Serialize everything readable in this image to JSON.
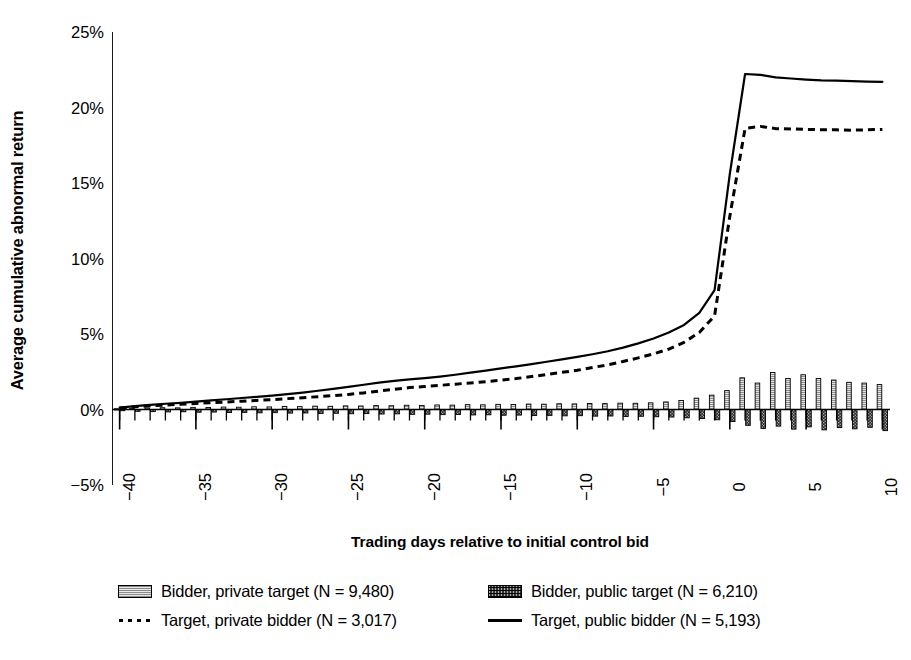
{
  "chart_data": {
    "type": "line",
    "title": "",
    "xlabel": "Trading days relative to initial control bid",
    "ylabel": "Average cumulative abnormal return",
    "xlim": [
      -40.5,
      10.5
    ],
    "ylim": [
      -0.05,
      0.25
    ],
    "ytick_labels": [
      "25%",
      "20%",
      "15%",
      "10%",
      "5%",
      "0%",
      "−5%"
    ],
    "ytick_values": [
      0.25,
      0.2,
      0.15,
      0.1,
      0.05,
      0.0,
      -0.05
    ],
    "xtick_labels": [
      "−40",
      "−35",
      "−30",
      "−25",
      "−20",
      "−15",
      "−10",
      "−5",
      "0",
      "5",
      "10"
    ],
    "xtick_values": [
      -40,
      -35,
      -30,
      -25,
      -20,
      -15,
      -10,
      -5,
      0,
      5,
      10
    ],
    "grid": false,
    "legend_position": "below",
    "x": [
      -40,
      -39,
      -38,
      -37,
      -36,
      -35,
      -34,
      -33,
      -32,
      -31,
      -30,
      -29,
      -28,
      -27,
      -26,
      -25,
      -24,
      -23,
      -22,
      -21,
      -20,
      -19,
      -18,
      -17,
      -16,
      -15,
      -14,
      -13,
      -12,
      -11,
      -10,
      -9,
      -8,
      -7,
      -6,
      -5,
      -4,
      -3,
      -2,
      -1,
      0,
      1,
      2,
      3,
      4,
      5,
      6,
      7,
      8,
      9,
      10
    ],
    "series": [
      {
        "name": "Bidder, private target (N = 9,480)",
        "style": "bar",
        "fill": "light-hatch",
        "values": [
          0.0005,
          0.0008,
          0.001,
          0.0012,
          0.0011,
          0.0014,
          0.0013,
          0.0016,
          0.0015,
          0.0018,
          0.0017,
          0.002,
          0.0019,
          0.0022,
          0.0021,
          0.0024,
          0.0023,
          0.0026,
          0.0025,
          0.0028,
          0.0027,
          0.003,
          0.0029,
          0.0032,
          0.0031,
          0.0034,
          0.0033,
          0.0036,
          0.0035,
          0.0038,
          0.0037,
          0.004,
          0.0039,
          0.0042,
          0.0041,
          0.0044,
          0.005,
          0.006,
          0.0075,
          0.0095,
          0.0125,
          0.021,
          0.0175,
          0.0245,
          0.0205,
          0.023,
          0.0205,
          0.0195,
          0.018,
          0.0175,
          0.0165
        ]
      },
      {
        "name": "Bidder, public target (N = 6,210)",
        "style": "bar",
        "fill": "dark-hatch",
        "values": [
          -0.0008,
          -0.0012,
          -0.0014,
          -0.0016,
          -0.0015,
          -0.0018,
          -0.0017,
          -0.002,
          -0.0019,
          -0.0022,
          -0.0021,
          -0.0024,
          -0.0023,
          -0.0026,
          -0.0025,
          -0.0028,
          -0.0027,
          -0.003,
          -0.0029,
          -0.0032,
          -0.0031,
          -0.0034,
          -0.0033,
          -0.0036,
          -0.0035,
          -0.0038,
          -0.0037,
          -0.004,
          -0.0039,
          -0.0042,
          -0.0041,
          -0.0044,
          -0.0043,
          -0.0046,
          -0.0045,
          -0.0048,
          -0.005,
          -0.0055,
          -0.006,
          -0.0068,
          -0.008,
          -0.0105,
          -0.0125,
          -0.011,
          -0.013,
          -0.0115,
          -0.0135,
          -0.012,
          -0.0128,
          -0.0118,
          -0.014
        ]
      },
      {
        "name": "Target, private bidder (N = 3,017)",
        "style": "dashed-line",
        "values": [
          0.001,
          0.0018,
          0.0024,
          0.003,
          0.0034,
          0.004,
          0.0045,
          0.005,
          0.0055,
          0.006,
          0.0065,
          0.0072,
          0.0078,
          0.0085,
          0.0092,
          0.01,
          0.011,
          0.0122,
          0.0134,
          0.0145,
          0.0152,
          0.016,
          0.0168,
          0.0176,
          0.0184,
          0.0195,
          0.0205,
          0.0218,
          0.0232,
          0.0246,
          0.026,
          0.0278,
          0.0296,
          0.0318,
          0.0342,
          0.0368,
          0.04,
          0.0445,
          0.051,
          0.062,
          0.128,
          0.1862,
          0.1875,
          0.186,
          0.1858,
          0.1855,
          0.1853,
          0.1852,
          0.185,
          0.1852,
          0.1855
        ]
      },
      {
        "name": "Target, public bidder (N = 5,193)",
        "style": "solid-line",
        "values": [
          0.0012,
          0.0022,
          0.003,
          0.0038,
          0.0044,
          0.0052,
          0.006,
          0.0068,
          0.0076,
          0.0084,
          0.0092,
          0.0102,
          0.0112,
          0.0124,
          0.0136,
          0.015,
          0.0164,
          0.0178,
          0.019,
          0.02,
          0.0208,
          0.0218,
          0.023,
          0.0244,
          0.0258,
          0.0272,
          0.0286,
          0.03,
          0.0316,
          0.0332,
          0.0348,
          0.0366,
          0.0386,
          0.041,
          0.0438,
          0.047,
          0.051,
          0.056,
          0.064,
          0.079,
          0.156,
          0.2222,
          0.2216,
          0.22,
          0.2192,
          0.2185,
          0.218,
          0.2178,
          0.2175,
          0.2172,
          0.217
        ]
      }
    ],
    "annotations": []
  },
  "legend": {
    "rows": [
      [
        {
          "label": "Bidder, private target (N = 9,480)",
          "marker": "light-bar"
        },
        {
          "label": "Bidder, public target (N = 6,210)",
          "marker": "dark-bar"
        }
      ],
      [
        {
          "label": "Target, private bidder (N = 3,017)",
          "marker": "dashed-line"
        },
        {
          "label": "Target, public bidder (N = 5,193)",
          "marker": "solid-line"
        }
      ]
    ]
  },
  "colors": {
    "axis": "#000000",
    "line": "#000000",
    "bar_light": "#c9c9c9",
    "bar_dark": "#333333",
    "background": "#ffffff"
  }
}
